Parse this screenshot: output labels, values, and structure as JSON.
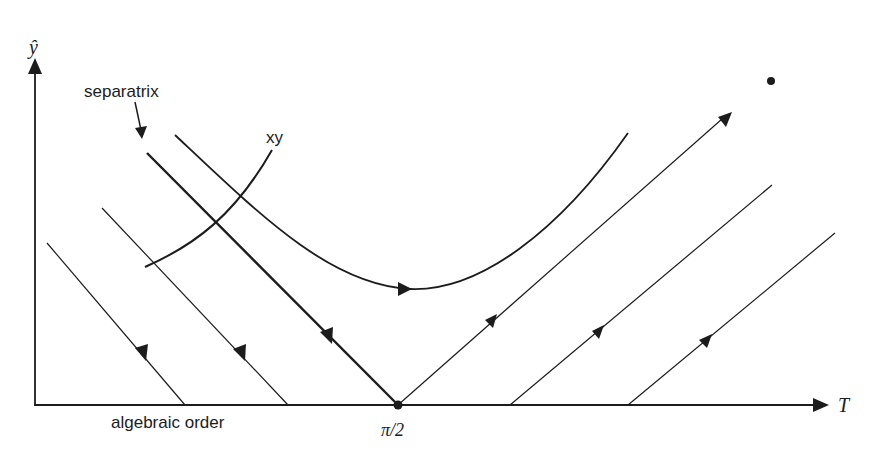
{
  "diagram": {
    "type": "phase-portrait",
    "axes": {
      "y_label": "ŷ",
      "x_label": "T",
      "x_tick_label": "π/2",
      "x_region_label": "algebraic order"
    },
    "annotations": {
      "separatrix_label": "separatrix",
      "curve_label": "xy"
    },
    "colors": {
      "stroke": "#1c1c1c",
      "background": "#ffffff"
    },
    "trajectories": [
      {
        "name": "left-descending-1",
        "direction": "down-right",
        "from": [
          47,
          243
        ],
        "to": [
          185,
          405
        ]
      },
      {
        "name": "left-descending-2",
        "direction": "down-right",
        "from": [
          102,
          208
        ],
        "to": [
          288,
          405
        ]
      },
      {
        "name": "separatrix",
        "direction": "down-right",
        "from": [
          147,
          153
        ],
        "to": [
          398,
          405
        ]
      },
      {
        "name": "upper-u-curve",
        "direction": "right",
        "shape": "U"
      },
      {
        "name": "xy-curve",
        "from": [
          145,
          267
        ],
        "to": [
          272,
          150
        ]
      },
      {
        "name": "right-ascending-1",
        "direction": "up-right",
        "from": [
          398,
          405
        ],
        "to": [
          730,
          112
        ]
      },
      {
        "name": "right-ascending-2",
        "direction": "up-right",
        "from": [
          510,
          405
        ],
        "to": [
          772,
          185
        ]
      },
      {
        "name": "right-ascending-3",
        "direction": "up-right",
        "from": [
          628,
          405
        ],
        "to": [
          835,
          233
        ]
      }
    ],
    "fixed_point": "π/2",
    "isolated_point": [
      771,
      81
    ]
  }
}
